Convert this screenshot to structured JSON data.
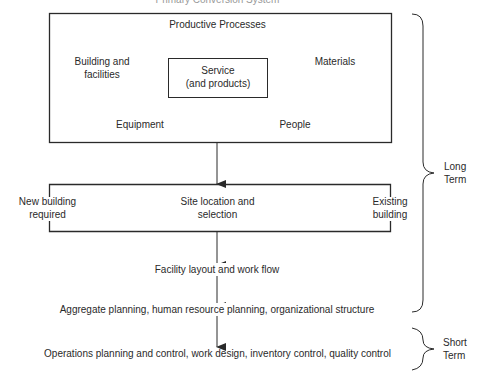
{
  "diagram": {
    "title": "Primary Conversion System",
    "productive_box": {
      "heading": "Productive Processes",
      "building": "Building and\nfacilities",
      "building_l1": "Building and",
      "building_l2": "facilities",
      "materials": "Materials",
      "equipment": "Equipment",
      "people": "People",
      "center_box": {
        "line1": "Service",
        "line2": "(and products)"
      }
    },
    "site_box": {
      "left_l1": "New building",
      "left_l2": "required",
      "center_l1": "Site location and",
      "center_l2": "selection",
      "right_l1": "Existing",
      "right_l2": "building"
    },
    "steps": [
      "Facility layout and work flow",
      "Aggregate planning, human resource planning, organizational structure",
      "Operations planning and control, work design, inventory control, quality control"
    ],
    "braces": [
      {
        "l1": "Long",
        "l2": "Term"
      },
      {
        "l1": "Short",
        "l2": "Term"
      }
    ],
    "line_color": "#2a2a2a"
  }
}
